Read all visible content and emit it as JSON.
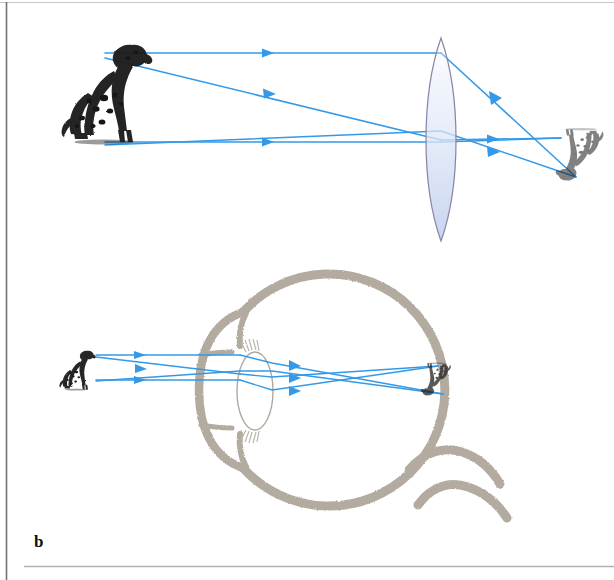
{
  "figure": {
    "panel_label": "b",
    "caption_text": "",
    "width_px": 614,
    "height_px": 580,
    "background_color": "#ffffff"
  },
  "colors": {
    "ray": "#3399e8",
    "ray_light": "#66b4ef",
    "eye_outline": "#b4aba0",
    "eye_outline_dark": "#a79d90",
    "lens_outline": "#8b86a8",
    "lens_fill_top": "#ffffff",
    "lens_fill_bottom": "#c8d4ee",
    "crystalline_lens_outline": "#b0a89c",
    "crystalline_lens_fill": "#ffffff",
    "dog_ink": "#1a1a1a",
    "border_line": "#6e6e6e",
    "label_color": "#111111"
  },
  "top_panel": {
    "name": "camera-lens-ray-diagram",
    "object": {
      "label": "dalmatian-dog-upright",
      "x": 60,
      "y": 40,
      "width": 100,
      "height": 108,
      "orientation": "upright"
    },
    "lens": {
      "label": "biconvex-converging-lens",
      "center_x": 441,
      "top_y": 38,
      "bottom_y": 241,
      "half_width": 19
    },
    "image": {
      "label": "inverted-dog-image",
      "x": 548,
      "y": 128,
      "width": 62,
      "height": 56,
      "orientation": "inverted"
    },
    "rays": [
      {
        "name": "ray-head-parallel",
        "points": "105,53 441,53 575,176"
      },
      {
        "name": "ray-head-oblique",
        "points": "105,58 441,140 560,137"
      },
      {
        "name": "ray-feet-parallel",
        "points": "105,142 441,142 560,137"
      },
      {
        "name": "ray-feet-oblique",
        "points": "105,145 441,131 575,176"
      }
    ],
    "arrowheads": [
      {
        "name": "arrowhead-top-incident",
        "x": 270,
        "y": 53
      },
      {
        "name": "arrowhead-middle-incident",
        "x": 272,
        "y": 94
      },
      {
        "name": "arrowhead-bottom-incident",
        "x": 270,
        "y": 142
      },
      {
        "name": "arrowhead-upper-refracted",
        "x": 498,
        "y": 98
      },
      {
        "name": "arrowhead-axis-refracted",
        "x": 498,
        "y": 139
      },
      {
        "name": "arrowhead-lower-refracted",
        "x": 498,
        "y": 152
      }
    ]
  },
  "bottom_panel": {
    "name": "human-eye-ray-diagram",
    "object": {
      "label": "dalmatian-dog-upright-small",
      "x": 58,
      "y": 348,
      "width": 38,
      "height": 42,
      "orientation": "upright"
    },
    "eye": {
      "label": "eyeball-cross-section",
      "center_x": 352,
      "center_y": 390,
      "radius": 116,
      "cornea_label": "cornea",
      "lens_label": "crystalline-lens",
      "retina_label": "retina",
      "optic_nerve_label": "optic-nerve"
    },
    "crystalline_lens": {
      "center_x": 255,
      "center_y": 381,
      "rx": 17,
      "ry": 35
    },
    "image": {
      "label": "inverted-retinal-image",
      "x": 420,
      "y": 360,
      "width": 32,
      "height": 36,
      "orientation": "inverted"
    },
    "rays": [
      {
        "name": "ray-head-parallel-eye",
        "points": "96,355 238,355 272,362 442,392"
      },
      {
        "name": "ray-head-oblique-eye",
        "points": "96,358 238,374 272,377 437,365"
      },
      {
        "name": "ray-feet-parallel-eye",
        "points": "96,380 238,380 272,389 437,365"
      },
      {
        "name": "ray-feet-oblique-eye",
        "points": "96,381 238,372 272,371 442,392"
      }
    ],
    "arrowheads": [
      {
        "name": "arrowhead-top-incident-eye",
        "x": 142,
        "y": 355
      },
      {
        "name": "arrowhead-middle-incident-eye",
        "x": 144,
        "y": 368
      },
      {
        "name": "arrowhead-bottom-incident-eye",
        "x": 142,
        "y": 380
      },
      {
        "name": "arrowhead-upper-refracted-eye",
        "x": 297,
        "y": 366
      },
      {
        "name": "arrowhead-axis-refracted-eye",
        "x": 297,
        "y": 378
      },
      {
        "name": "arrowhead-lower-refracted-eye",
        "x": 297,
        "y": 390
      }
    ]
  },
  "frame": {
    "left_rule_x": 6,
    "top_rule_y": 2,
    "bottom_rule_y": 566
  }
}
